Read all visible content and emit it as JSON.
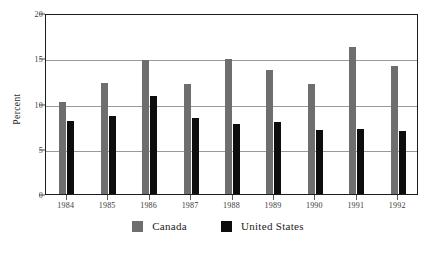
{
  "chart_data": {
    "type": "bar",
    "title": "",
    "subtitle": "",
    "xlabel": "",
    "ylabel": "Percent",
    "categories": [
      "1984",
      "1985",
      "1986",
      "1987",
      "1988",
      "1989",
      "1990",
      "1991",
      "1992"
    ],
    "series": [
      {
        "name": "Canada",
        "color": "#6e6e6e",
        "values": [
          10.2,
          12.3,
          14.8,
          12.2,
          14.9,
          13.7,
          12.2,
          16.3,
          14.2
        ]
      },
      {
        "name": "United States",
        "color": "#0d0d0d",
        "values": [
          8.1,
          8.6,
          10.8,
          8.4,
          7.7,
          8.0,
          7.1,
          7.2,
          7.0
        ]
      }
    ],
    "ylim": [
      0,
      20
    ],
    "yticks": [
      0,
      5,
      10,
      15,
      20
    ],
    "ytick_labels": [
      "0",
      "5",
      "10",
      "15",
      "20"
    ],
    "grid": true,
    "grid_axis": "y",
    "legend_position": "bottom-center"
  },
  "legend": {
    "items": [
      {
        "label": "Canada",
        "swatch": "canada"
      },
      {
        "label": "United States",
        "swatch": "us"
      }
    ]
  }
}
